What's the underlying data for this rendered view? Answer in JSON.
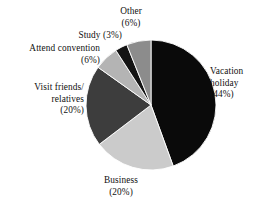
{
  "chart_data": {
    "type": "pie",
    "title": "",
    "subtitle": "",
    "xlabel": "",
    "ylabel": "",
    "legend_position": "none",
    "grid": false,
    "units": "percent",
    "start_angle_deg": 0,
    "direction": "clockwise",
    "categories": [
      "Vacation holiday",
      "Business",
      "Visit friends/relatives",
      "Attend convention",
      "Study",
      "Other"
    ],
    "values": [
      44,
      20,
      20,
      6,
      3,
      6
    ],
    "slices": [
      {
        "name": "Vacation holiday",
        "value": 44,
        "value_text": "(44%)",
        "color": "#0a0a0a",
        "label_lines": [
          "Vacation",
          "holiday",
          "(44%)"
        ],
        "label_align": "left"
      },
      {
        "name": "Business",
        "value": 20,
        "value_text": "(20%)",
        "color": "#cbcbcb",
        "label_lines": [
          "Business",
          "(20%)"
        ],
        "label_align": "center"
      },
      {
        "name": "Visit friends/relatives",
        "value": 20,
        "value_text": "(20%)",
        "color": "#3d3d3d",
        "label_lines": [
          "Visit friends/",
          "relatives",
          "(20%)"
        ],
        "label_align": "right"
      },
      {
        "name": "Attend convention",
        "value": 6,
        "value_text": "(6%)",
        "color": "#b4b4b4",
        "label_lines": [
          "Attend convention",
          "(6%)"
        ],
        "label_align": "right"
      },
      {
        "name": "Study",
        "value": 3,
        "value_text": "(3%)",
        "color": "#141414",
        "label_lines": [
          "Study (3%)"
        ],
        "label_align": "right"
      },
      {
        "name": "Other",
        "value": 6,
        "value_text": "(6%)",
        "color": "#8c8c8c",
        "label_lines": [
          "Other",
          "(6%)"
        ],
        "label_align": "center"
      }
    ],
    "geometry": {
      "center_x": 151,
      "center_y": 105,
      "radius": 65
    },
    "background_color": "#ffffff",
    "text_color": "#111111"
  },
  "labels": {
    "other": {
      "line1": "Other",
      "line2": "(6%)"
    },
    "study": {
      "line1": "Study (3%)"
    },
    "attend": {
      "line1": "Attend convention",
      "line2": "(6%)"
    },
    "visit": {
      "line1": "Visit friends/",
      "line2": "relatives",
      "line3": "(20%)"
    },
    "business": {
      "line1": "Business",
      "line2": "(20%)"
    },
    "vacation": {
      "line1": "Vacation",
      "line2": "holiday",
      "line3": "(44%)"
    }
  }
}
